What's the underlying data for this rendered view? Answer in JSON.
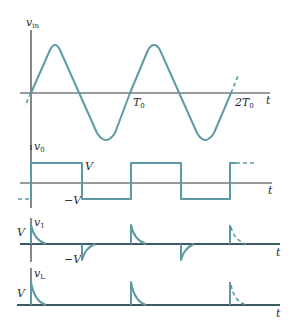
{
  "figure": {
    "panels": [
      {
        "id": "vin",
        "ylabel": "v",
        "ylabel_sub": "in",
        "xlabel": "t",
        "ticks": [
          {
            "label": "T",
            "sub": "0"
          },
          {
            "label": "2T",
            "sub": "0"
          }
        ]
      },
      {
        "id": "v0",
        "ylabel": "v",
        "ylabel_sub": "0",
        "xlabel": "t",
        "level_high": "V",
        "level_low": "−V"
      },
      {
        "id": "v1",
        "ylabel": "v",
        "ylabel_sub": "1",
        "xlabel": "t",
        "level_high": "V",
        "level_low": "−V"
      },
      {
        "id": "vL",
        "ylabel": "v",
        "ylabel_sub": "L",
        "xlabel": "t",
        "level_high": "V"
      }
    ],
    "colors": {
      "waveform": "#5e9aa3",
      "axis": "#2e3b3f",
      "text": "#2a2a2a"
    }
  }
}
